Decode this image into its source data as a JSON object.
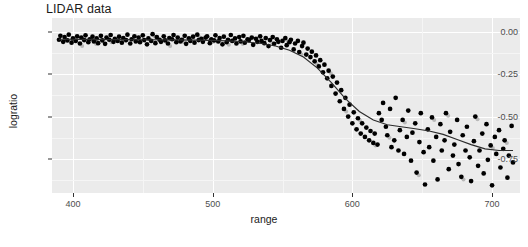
{
  "chart_data": {
    "type": "scatter",
    "title": "LIDAR data",
    "xlabel": "range",
    "ylabel": "logratio",
    "xlim": [
      385,
      720
    ],
    "ylim": [
      -0.95,
      0.08
    ],
    "grid": true,
    "legend": null,
    "xticks": [
      400,
      500,
      600,
      700
    ],
    "xtick_labels": [
      "400",
      "500",
      "600",
      "700"
    ],
    "yticks": [
      0.0,
      -0.25,
      -0.5,
      -0.75
    ],
    "ytick_labels": [
      "0.00",
      "-0.25",
      "-0.50",
      "-0.75"
    ],
    "series": [
      {
        "name": "observations",
        "marker": "filled-circle",
        "color": "#000000",
        "x": [
          390.0,
          391.0,
          393.0,
          394.0,
          396.0,
          397.0,
          399.0,
          400.0,
          402.0,
          403.0,
          405.0,
          406.0,
          408.0,
          409.0,
          411.0,
          412.0,
          414.0,
          415.0,
          417.0,
          418.0,
          420.0,
          421.0,
          423.0,
          424.0,
          426.0,
          427.0,
          429.0,
          430.0,
          432.0,
          433.0,
          435.0,
          436.0,
          438.0,
          439.0,
          441.0,
          442.0,
          444.0,
          445.0,
          447.0,
          448.0,
          450.0,
          451.0,
          453.0,
          454.0,
          456.0,
          457.0,
          459.0,
          460.0,
          462.0,
          463.0,
          465.0,
          466.0,
          468.0,
          469.0,
          471.0,
          472.0,
          474.0,
          475.0,
          477.0,
          478.0,
          480.0,
          481.0,
          483.0,
          484.0,
          486.0,
          487.0,
          489.0,
          490.0,
          492.0,
          493.0,
          495.0,
          496.0,
          498.0,
          499.0,
          501.0,
          502.0,
          504.0,
          505.0,
          507.0,
          508.0,
          510.0,
          511.0,
          513.0,
          514.0,
          516.0,
          517.0,
          519.0,
          520.0,
          522.0,
          523.0,
          525.0,
          526.0,
          528.0,
          529.0,
          531.0,
          532.0,
          534.0,
          535.0,
          537.0,
          538.0,
          540.0,
          541.0,
          543.0,
          544.0,
          546.0,
          547.0,
          549.0,
          550.0,
          552.0,
          553.0,
          555.0,
          556.0,
          558.0,
          559.0,
          561.0,
          562.0,
          564.0,
          565.0,
          567.0,
          568.0,
          570.0,
          571.0,
          573.0,
          574.0,
          576.0,
          577.0,
          579.0,
          580.0,
          582.0,
          583.0,
          585.0,
          586.0,
          588.0,
          589.0,
          591.0,
          592.0,
          594.0,
          595.0,
          597.0,
          598.0,
          600.0,
          601.0,
          603.0,
          604.0,
          606.0,
          607.0,
          609.0,
          610.0,
          612.0,
          613.0,
          615.0,
          616.0,
          618.0,
          619.0,
          621.0,
          622.0,
          624.0,
          625.0,
          627.0,
          628.0,
          630.0,
          631.0,
          633.0,
          634.0,
          636.0,
          637.0,
          639.0,
          640.0,
          642.0,
          643.0,
          645.0,
          646.0,
          648.0,
          649.0,
          651.0,
          652.0,
          654.0,
          655.0,
          657.0,
          658.0,
          660.0,
          661.0,
          663.0,
          664.0,
          666.0,
          667.0,
          669.0,
          670.0,
          672.0,
          673.0,
          675.0,
          676.0,
          678.0,
          679.0,
          681.0,
          682.0,
          684.0,
          685.0,
          687.0,
          688.0,
          690.0,
          691.0,
          693.0,
          694.0,
          696.0,
          697.0,
          699.0,
          700.0,
          702.0,
          703.0,
          705.0,
          706.0,
          708.0,
          709.0,
          711.0,
          712.0,
          714.0,
          715.0
        ],
        "y": [
          -0.048,
          -0.025,
          -0.06,
          -0.032,
          -0.052,
          -0.018,
          -0.065,
          -0.04,
          -0.055,
          -0.028,
          -0.07,
          -0.035,
          -0.05,
          -0.022,
          -0.062,
          -0.045,
          -0.03,
          -0.058,
          -0.04,
          -0.068,
          -0.025,
          -0.052,
          -0.072,
          -0.035,
          -0.048,
          -0.02,
          -0.06,
          -0.042,
          -0.055,
          -0.03,
          -0.065,
          -0.038,
          -0.05,
          -0.018,
          -0.07,
          -0.045,
          -0.028,
          -0.058,
          -0.035,
          -0.062,
          -0.022,
          -0.05,
          -0.075,
          -0.04,
          -0.055,
          -0.015,
          -0.068,
          -0.032,
          -0.048,
          -0.06,
          -0.028,
          -0.052,
          -0.07,
          -0.038,
          -0.045,
          -0.02,
          -0.062,
          -0.035,
          -0.058,
          -0.048,
          -0.025,
          -0.072,
          -0.04,
          -0.055,
          -0.03,
          -0.065,
          -0.018,
          -0.05,
          -0.042,
          -0.06,
          -0.035,
          -0.028,
          -0.068,
          -0.045,
          -0.052,
          -0.022,
          -0.058,
          -0.038,
          -0.075,
          -0.03,
          -0.062,
          -0.048,
          -0.02,
          -0.055,
          -0.04,
          -0.07,
          -0.032,
          -0.058,
          -0.025,
          -0.065,
          -0.045,
          -0.05,
          -0.035,
          -0.078,
          -0.042,
          -0.06,
          -0.028,
          -0.055,
          -0.068,
          -0.038,
          -0.085,
          -0.05,
          -0.032,
          -0.072,
          -0.045,
          -0.06,
          -0.095,
          -0.055,
          -0.038,
          -0.08,
          -0.062,
          -0.048,
          -0.105,
          -0.07,
          -0.055,
          -0.12,
          -0.085,
          -0.065,
          -0.135,
          -0.1,
          -0.15,
          -0.118,
          -0.175,
          -0.14,
          -0.205,
          -0.168,
          -0.24,
          -0.195,
          -0.275,
          -0.23,
          -0.32,
          -0.265,
          -0.365,
          -0.3,
          -0.41,
          -0.345,
          -0.455,
          -0.39,
          -0.5,
          -0.43,
          -0.54,
          -0.475,
          -0.575,
          -0.51,
          -0.6,
          -0.54,
          -0.62,
          -0.565,
          -0.64,
          -0.585,
          -0.655,
          -0.6,
          -0.665,
          -0.48,
          -0.52,
          -0.42,
          -0.56,
          -0.61,
          -0.455,
          -0.68,
          -0.64,
          -0.39,
          -0.7,
          -0.58,
          -0.52,
          -0.72,
          -0.62,
          -0.465,
          -0.76,
          -0.595,
          -0.54,
          -0.83,
          -0.65,
          -0.48,
          -0.71,
          -0.9,
          -0.575,
          -0.68,
          -0.505,
          -0.76,
          -0.62,
          -0.87,
          -0.545,
          -0.7,
          -0.64,
          -0.48,
          -0.81,
          -0.59,
          -0.73,
          -0.665,
          -0.52,
          -0.78,
          -0.855,
          -0.61,
          -0.7,
          -0.56,
          -0.74,
          -0.88,
          -0.645,
          -0.5,
          -0.79,
          -0.7,
          -0.6,
          -0.835,
          -0.545,
          -0.755,
          -0.67,
          -0.905,
          -0.62,
          -0.72,
          -0.58,
          -0.8,
          -0.69,
          -0.64,
          -0.86,
          -0.73,
          -0.555,
          -0.77
        ]
      },
      {
        "name": "smooth-fit",
        "type": "line",
        "color": "#2b2b2b",
        "x": [
          390,
          410,
          430,
          450,
          470,
          490,
          505,
          520,
          535,
          545,
          555,
          565,
          575,
          585,
          595,
          605,
          615,
          625,
          635,
          645,
          655,
          665,
          675,
          685,
          695,
          705,
          715
        ],
        "y": [
          -0.045,
          -0.046,
          -0.047,
          -0.048,
          -0.049,
          -0.05,
          -0.053,
          -0.058,
          -0.07,
          -0.085,
          -0.11,
          -0.15,
          -0.215,
          -0.3,
          -0.395,
          -0.47,
          -0.52,
          -0.548,
          -0.56,
          -0.572,
          -0.585,
          -0.605,
          -0.635,
          -0.665,
          -0.69,
          -0.7,
          -0.7
        ]
      }
    ]
  },
  "axis": {
    "x_title": "range",
    "y_title": "logratio"
  }
}
